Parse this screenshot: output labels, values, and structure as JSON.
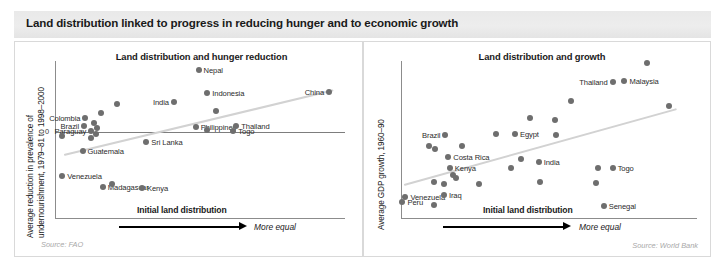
{
  "header": {
    "title": "Land distribution linked to progress in reducing hunger and to economic growth"
  },
  "panels": {
    "left": {
      "title": "Land distribution and hunger reduction",
      "ylabel_line1": "Average reduction in prevalence of",
      "ylabel_line2": "undernourishment, 1979–81 to 1998–2000",
      "zero_tick": "0",
      "xlabel": "Initial land distribution",
      "x_arrow_note": "More equal",
      "source": "Source: FAO"
    },
    "right": {
      "title": "Land distribution and growth",
      "ylabel": "Average GDP growth, 1960–90",
      "xlabel": "Initial land distribution",
      "x_arrow_note": "More equal",
      "source": "Source: World Bank"
    }
  },
  "colors": {
    "dot": "#6e6e6e",
    "trend": "#d2d2d2",
    "axis": "#8c8c8c",
    "title_bar": "#ebebeb",
    "panel_border": "#d9d9d9",
    "text": "#1a1a1a",
    "source_text": "#a8a8a8"
  },
  "chart_data": [
    {
      "id": "left",
      "type": "scatter",
      "title": "Land distribution and hunger reduction",
      "xlabel": "Initial land distribution",
      "ylabel": "Average reduction in prevalence of undernourishment, 1979–81 to 1998–2000",
      "xlim": [
        0,
        100
      ],
      "ylim": [
        -55,
        45
      ],
      "grid": false,
      "legend": null,
      "zero_reference_line": 0,
      "trendline": {
        "x0": 3,
        "y0": -14,
        "x1": 96,
        "y1": 27
      },
      "annotations": [
        "More equal"
      ],
      "points": [
        {
          "label": "Nepal",
          "x": 49.5,
          "y": 39.5,
          "label_side": "right"
        },
        {
          "label": "China",
          "x": 94.5,
          "y": 25.5,
          "label_side": "left"
        },
        {
          "label": "Indonesia",
          "x": 52.5,
          "y": 24.5,
          "label_side": "right"
        },
        {
          "label": "India",
          "x": 41.0,
          "y": 19.0,
          "label_side": "left"
        },
        {
          "label": "",
          "x": 55.5,
          "y": 13.5,
          "label_side": "none"
        },
        {
          "label": "",
          "x": 21.5,
          "y": 17.5,
          "label_side": "none"
        },
        {
          "label": "",
          "x": 16.0,
          "y": 12.0,
          "label_side": "none"
        },
        {
          "label": "Colombia",
          "x": 10.5,
          "y": 9.0,
          "label_side": "left"
        },
        {
          "label": "",
          "x": 13.5,
          "y": 6.0,
          "label_side": "none"
        },
        {
          "label": "Brazil",
          "x": 10.0,
          "y": 4.0,
          "label_side": "left"
        },
        {
          "label": "Paraguay",
          "x": 12.5,
          "y": 1.0,
          "label_side": "left"
        },
        {
          "label": "",
          "x": 14.5,
          "y": 2.5,
          "label_side": "none"
        },
        {
          "label": "",
          "x": 14.0,
          "y": -1.0,
          "label_side": "none"
        },
        {
          "label": "",
          "x": 2.5,
          "y": -2.5,
          "label_side": "none"
        },
        {
          "label": "",
          "x": 12.5,
          "y": -3.5,
          "label_side": "none"
        },
        {
          "label": "Philippines",
          "x": 48.5,
          "y": 3.5,
          "label_side": "none"
        },
        {
          "label": "",
          "x": 52.5,
          "y": 1.5,
          "label_side": "none"
        },
        {
          "label": "Thailand",
          "x": 62.5,
          "y": 4.0,
          "label_side": "right"
        },
        {
          "label": "Togo",
          "x": 61.5,
          "y": 0.5,
          "label_side": "right"
        },
        {
          "label": "Sri Lanka",
          "x": 31.5,
          "y": -6.5,
          "label_side": "right"
        },
        {
          "label": "Guatemala",
          "x": 9.5,
          "y": -12.0,
          "label_side": "right"
        },
        {
          "label": "Venezuela",
          "x": 2.5,
          "y": -28.0,
          "label_side": "none"
        },
        {
          "label": "Madagascar",
          "x": 16.5,
          "y": -34.5,
          "label_side": "none"
        },
        {
          "label": "",
          "x": 19.5,
          "y": -33.0,
          "label_side": "none"
        },
        {
          "label": "Kenya",
          "x": 30.0,
          "y": -35.5,
          "label_side": "right"
        }
      ]
    },
    {
      "id": "right",
      "type": "scatter",
      "title": "Land distribution and growth",
      "xlabel": "Initial land distribution",
      "ylabel": "Average GDP growth, 1960–90",
      "xlim": [
        0,
        100
      ],
      "ylim": [
        0,
        100
      ],
      "grid": false,
      "legend": null,
      "trendline": {
        "x0": 1,
        "y0": 22,
        "x1": 93,
        "y1": 70
      },
      "annotations": [
        "More equal"
      ],
      "points": [
        {
          "label": "",
          "x": 83.0,
          "y": 98.5,
          "label_side": "none"
        },
        {
          "label": "Thailand",
          "x": 71.5,
          "y": 87.0,
          "label_side": "left"
        },
        {
          "label": "Malaysia",
          "x": 75.5,
          "y": 87.5,
          "label_side": "right"
        },
        {
          "label": "",
          "x": 57.5,
          "y": 74.5,
          "label_side": "none"
        },
        {
          "label": "",
          "x": 90.5,
          "y": 71.5,
          "label_side": "none"
        },
        {
          "label": "",
          "x": 43.5,
          "y": 64.0,
          "label_side": "none"
        },
        {
          "label": "",
          "x": 52.0,
          "y": 62.5,
          "label_side": "none"
        },
        {
          "label": "Egypt",
          "x": 38.5,
          "y": 54.0,
          "label_side": "none"
        },
        {
          "label": "Brazil",
          "x": 15.0,
          "y": 53.0,
          "label_side": "left"
        },
        {
          "label": "",
          "x": 32.0,
          "y": 53.5,
          "label_side": "none"
        },
        {
          "label": "",
          "x": 52.5,
          "y": 53.0,
          "label_side": "none"
        },
        {
          "label": "",
          "x": 9.5,
          "y": 46.5,
          "label_side": "none"
        },
        {
          "label": "",
          "x": 11.5,
          "y": 44.5,
          "label_side": "none"
        },
        {
          "label": "",
          "x": 20.5,
          "y": 46.5,
          "label_side": "none"
        },
        {
          "label": "Costa Rica",
          "x": 16.0,
          "y": 39.0,
          "label_side": "none"
        },
        {
          "label": "",
          "x": 40.5,
          "y": 38.0,
          "label_side": "none"
        },
        {
          "label": "India",
          "x": 46.5,
          "y": 36.0,
          "label_side": "right"
        },
        {
          "label": "",
          "x": 37.0,
          "y": 32.5,
          "label_side": "none"
        },
        {
          "label": "Kenya",
          "x": 16.5,
          "y": 32.0,
          "label_side": "none"
        },
        {
          "label": "",
          "x": 66.5,
          "y": 32.5,
          "label_side": "none"
        },
        {
          "label": "Togo",
          "x": 71.5,
          "y": 32.5,
          "label_side": "right"
        },
        {
          "label": "",
          "x": 17.5,
          "y": 28.0,
          "label_side": "none"
        },
        {
          "label": "",
          "x": 18.5,
          "y": 26.0,
          "label_side": "none"
        },
        {
          "label": "",
          "x": 11.0,
          "y": 23.5,
          "label_side": "none"
        },
        {
          "label": "",
          "x": 14.5,
          "y": 22.0,
          "label_side": "none"
        },
        {
          "label": "",
          "x": 47.0,
          "y": 23.5,
          "label_side": "none"
        },
        {
          "label": "",
          "x": 26.5,
          "y": 22.0,
          "label_side": "none"
        },
        {
          "label": "",
          "x": 66.0,
          "y": 22.5,
          "label_side": "none"
        },
        {
          "label": "Venezuela",
          "x": 1.5,
          "y": 14.0,
          "label_side": "none"
        },
        {
          "label": "Iraq",
          "x": 14.5,
          "y": 15.0,
          "label_side": "none"
        },
        {
          "label": "Peru",
          "x": 0.5,
          "y": 10.5,
          "label_side": "none"
        },
        {
          "label": "",
          "x": 11.0,
          "y": 9.0,
          "label_side": "none"
        },
        {
          "label": "Senegal",
          "x": 68.5,
          "y": 8.5,
          "label_side": "right"
        }
      ]
    }
  ]
}
